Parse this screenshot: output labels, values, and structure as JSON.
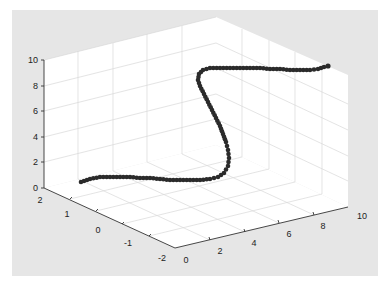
{
  "colors": {
    "figure_bg": "#e8e8e8",
    "pane": "#ffffff",
    "grid": "#dcdcdc",
    "axis": "#333333",
    "marker": "#2b2b2b"
  },
  "chart_data": {
    "type": "scatter",
    "subtype": "3d-scatter",
    "title": "",
    "xlabel": "",
    "ylabel": "",
    "zlabel": "",
    "x_ticks": [
      "0",
      "2",
      "4",
      "6",
      "8",
      "10"
    ],
    "y_ticks": [
      "-2",
      "-1",
      "0",
      "1",
      "2"
    ],
    "z_ticks": [
      "0",
      "2",
      "4",
      "6",
      "8",
      "10"
    ],
    "xlim": [
      0,
      10
    ],
    "ylim": [
      -2,
      2
    ],
    "zlim": [
      0,
      10
    ],
    "grid": true,
    "legend": null,
    "marker": "filled circle",
    "series": [
      {
        "name": "curve",
        "points_approx": [
          {
            "x": 0.0,
            "y": 0.0,
            "z": 0.3
          },
          {
            "x": 1.0,
            "y": 0.5,
            "z": 0.6
          },
          {
            "x": 2.0,
            "y": 0.7,
            "z": 0.6
          },
          {
            "x": 3.0,
            "y": 0.7,
            "z": 0.6
          },
          {
            "x": 4.0,
            "y": 0.5,
            "z": 0.7
          },
          {
            "x": 4.7,
            "y": 0.0,
            "z": 1.5
          },
          {
            "x": 5.0,
            "y": -0.3,
            "z": 3.0
          },
          {
            "x": 5.0,
            "y": -0.2,
            "z": 5.0
          },
          {
            "x": 5.0,
            "y": 0.2,
            "z": 7.0
          },
          {
            "x": 5.3,
            "y": 0.3,
            "z": 8.5
          },
          {
            "x": 6.0,
            "y": -0.5,
            "z": 9.3
          },
          {
            "x": 7.0,
            "y": -0.7,
            "z": 9.4
          },
          {
            "x": 8.0,
            "y": -0.7,
            "z": 9.4
          },
          {
            "x": 9.0,
            "y": -0.5,
            "z": 9.4
          },
          {
            "x": 10.0,
            "y": 0.0,
            "z": 9.7
          }
        ]
      }
    ]
  },
  "caption": ""
}
